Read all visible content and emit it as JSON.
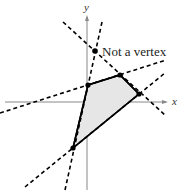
{
  "axes": {
    "x_label": "x",
    "y_label": "y"
  },
  "annotation": {
    "text": "Not a vertex"
  },
  "region": {
    "fill": "#e6e6e6",
    "stroke": "#000000",
    "vertices": [
      [
        88,
        85
      ],
      [
        120,
        75
      ],
      [
        139,
        94
      ],
      [
        73,
        148
      ]
    ]
  },
  "boundary_lines": {
    "style": "dashed",
    "count": 4
  }
}
